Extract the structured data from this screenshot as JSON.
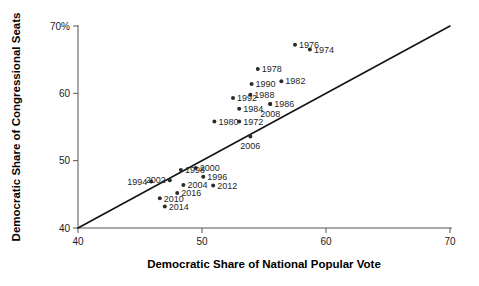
{
  "chart_data": {
    "type": "scatter",
    "title": "",
    "xlabel": "Democratic Share of National Popular Vote",
    "ylabel": "Democratic Share of Congressional Seats",
    "xlim": [
      40,
      70
    ],
    "ylim": [
      40,
      70
    ],
    "grid": false,
    "legend": null,
    "xticks": [
      "40",
      "50",
      "60",
      "70"
    ],
    "xtick_values": [
      40,
      50,
      60,
      70
    ],
    "yticks": [
      "40",
      "50",
      "60",
      "70%"
    ],
    "ytick_values": [
      40,
      50,
      60,
      70
    ],
    "reference_line": {
      "name": "forty-five-degree-line",
      "from": [
        40,
        40
      ],
      "to": [
        70,
        70
      ],
      "description": "y = x diagonal"
    },
    "point_label_field": "year",
    "points": [
      {
        "year": "1972",
        "x": 53.0,
        "y": 55.8,
        "label_side": "right"
      },
      {
        "year": "1974",
        "x": 58.7,
        "y": 66.5,
        "label_side": "right"
      },
      {
        "year": "1976",
        "x": 57.5,
        "y": 67.2,
        "label_side": "right"
      },
      {
        "year": "1978",
        "x": 54.5,
        "y": 63.6,
        "label_side": "right"
      },
      {
        "year": "1980",
        "x": 51.0,
        "y": 55.8,
        "label_side": "right"
      },
      {
        "year": "1982",
        "x": 56.4,
        "y": 61.8,
        "label_side": "right"
      },
      {
        "year": "1984",
        "x": 53.0,
        "y": 57.7,
        "label_side": "right"
      },
      {
        "year": "1986",
        "x": 55.5,
        "y": 58.4,
        "label_side": "right"
      },
      {
        "year": "1988",
        "x": 53.9,
        "y": 59.8,
        "label_side": "right"
      },
      {
        "year": "1990",
        "x": 54.0,
        "y": 61.4,
        "label_side": "right"
      },
      {
        "year": "1992",
        "x": 52.5,
        "y": 59.3,
        "label_side": "right"
      },
      {
        "year": "1994",
        "x": 45.9,
        "y": 46.9,
        "label_side": "left"
      },
      {
        "year": "1996",
        "x": 50.1,
        "y": 47.6,
        "label_side": "right"
      },
      {
        "year": "1998",
        "x": 48.3,
        "y": 48.6,
        "label_side": "right"
      },
      {
        "year": "2000",
        "x": 49.5,
        "y": 48.9,
        "label_side": "right"
      },
      {
        "year": "2002",
        "x": 47.4,
        "y": 47.1,
        "label_side": "left"
      },
      {
        "year": "2004",
        "x": 48.5,
        "y": 46.4,
        "label_side": "right"
      },
      {
        "year": "2006",
        "x": 53.9,
        "y": 53.6,
        "label_side": "below"
      },
      {
        "year": "2008",
        "x": 55.5,
        "y": 58.4,
        "label_side": "below"
      },
      {
        "year": "2010",
        "x": 46.6,
        "y": 44.4,
        "label_side": "right"
      },
      {
        "year": "2012",
        "x": 50.9,
        "y": 46.3,
        "label_side": "right"
      },
      {
        "year": "2014",
        "x": 47.0,
        "y": 43.2,
        "label_side": "right"
      },
      {
        "year": "2016",
        "x": 48.0,
        "y": 45.2,
        "label_side": "right"
      }
    ],
    "colors": {
      "marker": "#2b2b2b",
      "reference_line": "#141414",
      "axis": "#555555",
      "text": "#1a1a1a",
      "background": "#ffffff"
    }
  }
}
